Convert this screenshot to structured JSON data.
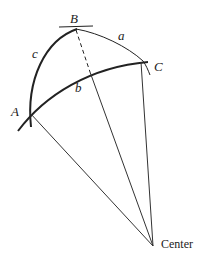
{
  "diagram": {
    "vertices": {
      "A": {
        "label": "A"
      },
      "B": {
        "label": "B"
      },
      "C": {
        "label": "C"
      }
    },
    "sides": {
      "a": {
        "label": "a"
      },
      "b": {
        "label": "b"
      },
      "c": {
        "label": "c"
      }
    },
    "center": {
      "label": "Center"
    },
    "colors": {
      "stroke": "#222222",
      "background": "#ffffff"
    }
  }
}
